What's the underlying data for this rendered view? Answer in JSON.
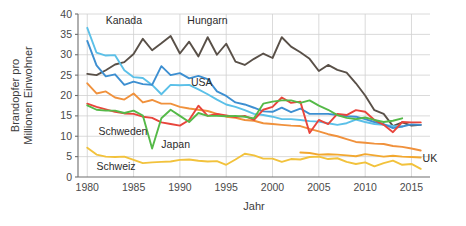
{
  "chart_data": {
    "type": "line",
    "title": "",
    "xlabel": "Jahr",
    "ylabel_line1": "Brandopfer pro",
    "ylabel_line2": "Millionen Einwohner",
    "xlim": [
      1979,
      2017
    ],
    "ylim": [
      0,
      40
    ],
    "xticks": [
      1980,
      1985,
      1990,
      1995,
      2000,
      2005,
      2010,
      2015
    ],
    "yticks": [
      0,
      5,
      10,
      15,
      20,
      25,
      30,
      35,
      40
    ],
    "grid": true,
    "legend_position": "inline-labels",
    "annotations": [
      {
        "text": "Kanada",
        "x": 1982.0,
        "y": 37.6,
        "anchor": "start"
      },
      {
        "text": "Hungarn",
        "x": 1990.8,
        "y": 37.6,
        "anchor": "start"
      },
      {
        "text": "USA",
        "x": 1991.2,
        "y": 22.4,
        "anchor": "start"
      },
      {
        "text": "Schweden",
        "x": 1981.2,
        "y": 10.3,
        "anchor": "start"
      },
      {
        "text": "Japan",
        "x": 1988.0,
        "y": 7.2,
        "anchor": "start"
      },
      {
        "text": "Schweiz",
        "x": 1981.0,
        "y": 1.6,
        "anchor": "start"
      },
      {
        "text": "UK",
        "x": 2016.2,
        "y": 3.8,
        "anchor": "start"
      }
    ],
    "series": [
      {
        "name": "Hungarn",
        "color": "#595048",
        "x": [
          1980,
          1981,
          1982,
          1983,
          1984,
          1985,
          1986,
          1987,
          1988,
          1989,
          1990,
          1991,
          1992,
          1993,
          1994,
          1995,
          1996,
          1997,
          1998,
          1999,
          2000,
          2001,
          2002,
          2003,
          2004,
          2005,
          2006,
          2007,
          2008,
          2009,
          2010,
          2011,
          2012,
          2013,
          2014,
          2015,
          2016
        ],
        "values": [
          25.3,
          25.0,
          26.2,
          27.6,
          28.2,
          30.2,
          33.9,
          31.1,
          32.8,
          34.6,
          30.3,
          33.2,
          29.6,
          34.3,
          30.0,
          32.7,
          28.3,
          27.5,
          29.0,
          30.3,
          29.2,
          34.3,
          32.0,
          30.6,
          29.0,
          26.0,
          27.5,
          26.3,
          25.6,
          23.0,
          20.0,
          16.4,
          15.5,
          12.5,
          13.4,
          12.6,
          12.8
        ]
      },
      {
        "name": "Kanada",
        "color": "#5bc0e8",
        "x": [
          1980,
          1981,
          1982,
          1983,
          1984,
          1985,
          1986,
          1987,
          1988,
          1989,
          1990,
          1991,
          1992,
          1993,
          1994,
          1995,
          1996,
          1997,
          1998,
          1999,
          2000,
          2001,
          2002,
          2003,
          2004,
          2005,
          2006,
          2007,
          2008,
          2009,
          2010,
          2011,
          2012,
          2013,
          2014
        ],
        "values": [
          36.6,
          30.5,
          29.8,
          29.9,
          26.2,
          24.5,
          24.3,
          22.6,
          20.3,
          22.6,
          22.5,
          22.6,
          21.5,
          20.3,
          19.0,
          17.8,
          17.2,
          16.4,
          15.5,
          15.2,
          14.8,
          14.2,
          14.2,
          14.0,
          13.7,
          13.6,
          13.2,
          12.8,
          13.2,
          14.1,
          13.5,
          13.0,
          12.8,
          12.5,
          12.4
        ]
      },
      {
        "name": "USA",
        "color": "#3d8fd1",
        "x": [
          1980,
          1981,
          1982,
          1983,
          1984,
          1985,
          1986,
          1987,
          1988,
          1989,
          1990,
          1991,
          1992,
          1993,
          1994,
          1995,
          1996,
          1997,
          1998,
          1999,
          2000,
          2001,
          2002,
          2003,
          2004,
          2005,
          2006,
          2007,
          2008,
          2009,
          2010,
          2011,
          2012,
          2013,
          2014,
          2015,
          2016
        ],
        "values": [
          33.4,
          27.4,
          24.7,
          25.2,
          22.6,
          23.4,
          22.8,
          22.6,
          27.2,
          25.0,
          25.5,
          24.2,
          24.8,
          24.0,
          21.0,
          19.9,
          18.3,
          17.8,
          17.0,
          16.1,
          16.0,
          17.0,
          15.9,
          16.8,
          15.5,
          15.5,
          15.5,
          15.2,
          14.9,
          14.8,
          14.2,
          13.5,
          13.0,
          12.0,
          12.4,
          12.9,
          12.8
        ]
      },
      {
        "name": "Serie-Orange-hell",
        "color": "#f0913c",
        "x": [
          1980,
          1981,
          1982,
          1983,
          1984,
          1985,
          1986,
          1987,
          1988,
          1989,
          1990,
          1991,
          1992,
          1993,
          1994,
          1995,
          1996,
          1997,
          1998,
          1999,
          2000,
          2001,
          2002,
          2003,
          2004,
          2005,
          2006,
          2007,
          2008,
          2009,
          2010,
          2011,
          2012,
          2013,
          2014,
          2015,
          2016
        ],
        "values": [
          23.0,
          20.5,
          21.0,
          19.5,
          19.0,
          20.5,
          18.3,
          18.9,
          18.0,
          18.0,
          17.2,
          16.8,
          16.5,
          16.2,
          15.5,
          14.8,
          14.5,
          14.0,
          13.8,
          13.2,
          13.0,
          12.8,
          12.6,
          12.5,
          11.8,
          11.2,
          10.5,
          10.0,
          9.3,
          8.6,
          8.4,
          8.2,
          8.1,
          7.6,
          7.4,
          7.0,
          6.5
        ]
      },
      {
        "name": "Serie-Rot",
        "color": "#e8453c",
        "x": [
          1980,
          1981,
          1982,
          1983,
          1984,
          1985,
          1986,
          1987,
          1988,
          1989,
          1990,
          1991,
          1992,
          1993,
          1994,
          1995,
          1996,
          1997,
          1998,
          1999,
          2000,
          2001,
          2002,
          2003,
          2004,
          2005,
          2006,
          2007,
          2008,
          2009,
          2010,
          2011,
          2012,
          2013,
          2014,
          2015,
          2016
        ],
        "values": [
          18.0,
          17.2,
          16.6,
          16.0,
          15.6,
          15.5,
          14.8,
          14.5,
          13.4,
          13.0,
          12.6,
          14.0,
          17.5,
          15.0,
          15.5,
          15.1,
          14.7,
          15.0,
          14.0,
          16.5,
          17.2,
          19.5,
          18.2,
          18.5,
          10.8,
          14.0,
          13.0,
          15.5,
          15.2,
          16.4,
          16.0,
          14.0,
          12.8,
          11.0,
          13.5,
          13.4,
          13.4
        ]
      },
      {
        "name": "Serie-Gruen",
        "color": "#55b948",
        "x": [
          1980,
          1981,
          1982,
          1983,
          1984,
          1985,
          1986,
          1987,
          1988,
          1989,
          1990,
          1991,
          1992,
          1993,
          1994,
          1995,
          1996,
          1997,
          1998,
          1999,
          2000,
          2001,
          2002,
          2003,
          2004,
          2005,
          2006,
          2007,
          2008,
          2009,
          2010,
          2011,
          2012,
          2013,
          2014
        ],
        "values": [
          17.6,
          16.5,
          16.3,
          16.3,
          15.7,
          16.3,
          15.1,
          7.0,
          14.4,
          16.5,
          15.0,
          13.5,
          15.7,
          15.0,
          15.0,
          14.9,
          15.0,
          14.8,
          14.4,
          18.0,
          18.5,
          18.8,
          18.8,
          18.2,
          18.8,
          17.5,
          16.5,
          15.2,
          14.5,
          14.2,
          14.6,
          14.0,
          13.5,
          13.8,
          14.4
        ]
      },
      {
        "name": "Schweiz",
        "color": "#f2c23c",
        "x": [
          1980,
          1981,
          1982,
          1983,
          1984,
          1986,
          1987,
          1988,
          1989,
          1990,
          1991,
          1992,
          1993,
          1994,
          1995,
          1996,
          1997,
          1998,
          1999,
          2000,
          2001,
          2002,
          2003,
          2004,
          2005,
          2006,
          2007,
          2008,
          2009,
          2010,
          2011,
          2012,
          2013,
          2014,
          2015,
          2016
        ],
        "values": [
          7.2,
          5.5,
          5.0,
          4.9,
          5.0,
          3.4,
          3.6,
          3.7,
          3.8,
          4.2,
          4.3,
          4.0,
          3.8,
          3.9,
          3.0,
          4.3,
          5.7,
          5.3,
          4.5,
          4.5,
          3.7,
          4.4,
          4.3,
          4.9,
          5.0,
          4.4,
          4.6,
          3.7,
          3.2,
          3.6,
          2.6,
          3.4,
          4.0,
          3.0,
          3.2,
          2.0
        ]
      },
      {
        "name": "UK",
        "color": "#f2a830",
        "x": [
          2003,
          2004,
          2005,
          2006,
          2007,
          2008,
          2009,
          2010,
          2011,
          2012,
          2013,
          2014,
          2015,
          2016
        ],
        "values": [
          6.0,
          5.9,
          5.5,
          5.6,
          5.5,
          5.3,
          5.1,
          5.6,
          5.3,
          5.0,
          5.2,
          5.0,
          4.9,
          4.8
        ]
      }
    ]
  }
}
